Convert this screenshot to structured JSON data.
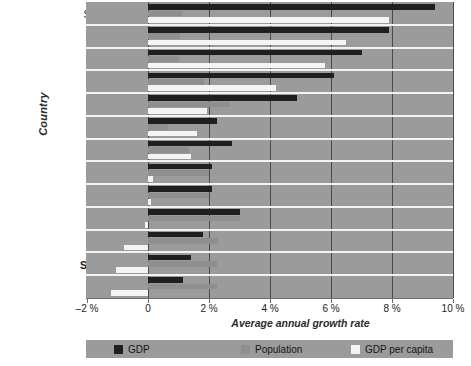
{
  "chart_data": {
    "type": "bar",
    "title": "",
    "xlabel": "Average annual growth rate",
    "ylabel": "Country",
    "orientation": "horizontal",
    "grouped": true,
    "xlim": [
      -2,
      10
    ],
    "xticks": [
      "-2 %",
      "0",
      "2 %",
      "4 %",
      "6 %",
      "8 %",
      "10 %"
    ],
    "xtick_values": [
      -2,
      0,
      2,
      4,
      6,
      8,
      10
    ],
    "grid": "vertical",
    "legend_position": "bottom",
    "categories": [
      "South Korea",
      "Taiwan",
      "Singapore",
      "Thailand",
      "Turkey",
      "Portugal",
      "Chile",
      "Mexico",
      "Brazil",
      "Paraguay",
      "Philippines",
      "South Africa",
      "Peru"
    ],
    "highlighted_category": "South Africa",
    "series": [
      {
        "name": "GDP",
        "color": "#1f1f1f",
        "values": [
          9.4,
          7.9,
          7.0,
          6.1,
          4.9,
          2.25,
          2.75,
          2.1,
          2.1,
          3.0,
          1.8,
          1.4,
          1.15
        ]
      },
      {
        "name": "Population",
        "color": "#8f8f8f",
        "values": [
          1.1,
          1.05,
          1.0,
          1.85,
          2.7,
          0.65,
          1.35,
          2.0,
          2.0,
          3.0,
          2.3,
          2.25,
          2.25
        ]
      },
      {
        "name": "GDP per capita",
        "color": "#f4f4f4",
        "values": [
          7.9,
          6.5,
          5.8,
          4.2,
          1.95,
          1.6,
          1.4,
          0.15,
          0.1,
          -0.1,
          -0.8,
          -1.05,
          -1.2
        ]
      }
    ]
  },
  "legend": {
    "items": [
      {
        "label": "GDP",
        "swatch": "gdp"
      },
      {
        "label": "Population",
        "swatch": "pop"
      },
      {
        "label": "GDP per capita",
        "swatch": "cap"
      }
    ]
  }
}
